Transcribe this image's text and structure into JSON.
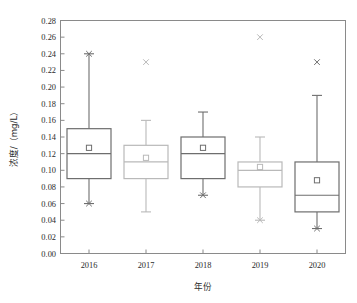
{
  "chart_data": {
    "type": "box",
    "title": "",
    "xlabel": "年份",
    "ylabel": "浓度/（mg/L）",
    "categories": [
      "2016",
      "2017",
      "2018",
      "2019",
      "2020"
    ],
    "ylim": [
      0.0,
      0.28
    ],
    "ytick_step": 0.02,
    "grid": false,
    "legend": "none",
    "yticks": [
      "0.00",
      "0.02",
      "0.04",
      "0.06",
      "0.08",
      "0.10",
      "0.12",
      "0.14",
      "0.16",
      "0.18",
      "0.20",
      "0.22",
      "0.24",
      "0.26",
      "0.28"
    ],
    "boxes": [
      {
        "category": "2016",
        "whisker_low": 0.06,
        "q1": 0.09,
        "median": 0.12,
        "q3": 0.15,
        "whisker_high": 0.24,
        "mean": 0.127,
        "outliers": [
          0.24,
          0.06
        ],
        "color": "#6e6e6e"
      },
      {
        "category": "2017",
        "whisker_low": 0.05,
        "q1": 0.09,
        "median": 0.11,
        "q3": 0.13,
        "whisker_high": 0.16,
        "mean": 0.115,
        "outliers": [
          0.23
        ],
        "color": "#b9b9b9"
      },
      {
        "category": "2018",
        "whisker_low": 0.07,
        "q1": 0.09,
        "median": 0.12,
        "q3": 0.14,
        "whisker_high": 0.17,
        "mean": 0.127,
        "outliers": [
          0.07
        ],
        "color": "#6e6e6e"
      },
      {
        "category": "2019",
        "whisker_low": 0.04,
        "q1": 0.08,
        "median": 0.1,
        "q3": 0.11,
        "whisker_high": 0.14,
        "mean": 0.104,
        "outliers": [
          0.26,
          0.04
        ],
        "color": "#b9b9b9"
      },
      {
        "category": "2020",
        "whisker_low": 0.03,
        "q1": 0.05,
        "median": 0.07,
        "q3": 0.11,
        "whisker_high": 0.19,
        "mean": 0.088,
        "outliers": [
          0.23,
          0.03
        ],
        "color": "#6e6e6e"
      }
    ],
    "markers": {
      "mean_symbol": "open-square",
      "outlier_symbol": "x-cross"
    }
  }
}
